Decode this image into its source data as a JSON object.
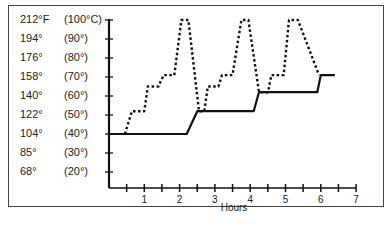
{
  "chart_data": {
    "type": "line",
    "title": "",
    "xlabel": "Hours",
    "ylabel": "Temperature",
    "xlim": [
      0,
      7
    ],
    "ylim": [
      15,
      100
    ],
    "x_ticks": [
      1,
      2,
      3,
      4,
      5,
      6,
      7
    ],
    "x_minor_ticks": [
      0.5,
      1.5,
      2.5,
      3.5,
      4.5,
      5.5,
      6.5
    ],
    "y_ticks": [
      {
        "c": 100,
        "label_f": "212°F",
        "label_c": "(100°C)"
      },
      {
        "c": 90,
        "label_f": "194°",
        "label_c": "(90°)"
      },
      {
        "c": 80,
        "label_f": "176°",
        "label_c": "(80°)"
      },
      {
        "c": 70,
        "label_f": "158°",
        "label_c": "(70°)"
      },
      {
        "c": 60,
        "label_f": "140°",
        "label_c": "(60°)"
      },
      {
        "c": 50,
        "label_f": "122°",
        "label_c": "(50°)"
      },
      {
        "c": 40,
        "label_f": "104°",
        "label_c": "(40°)"
      },
      {
        "c": 30,
        "label_f": "85°",
        "label_c": "(30°)"
      },
      {
        "c": 20,
        "label_f": "68°",
        "label_c": "(20°)"
      }
    ],
    "grid": false,
    "legend": null,
    "series": [
      {
        "name": "solid",
        "style": "solid",
        "x": [
          0,
          2.2,
          2.5,
          4.1,
          4.25,
          5.9,
          6.0,
          6.4
        ],
        "y": [
          40,
          40,
          52,
          52,
          62,
          62,
          71,
          71
        ]
      },
      {
        "name": "dotted",
        "style": "dotted",
        "x": [
          0.45,
          0.65,
          1.0,
          1.1,
          1.4,
          1.55,
          1.85,
          2.05,
          2.25,
          2.55,
          2.7,
          2.8,
          3.1,
          3.2,
          3.5,
          3.75,
          3.95,
          4.25,
          4.5,
          4.6,
          4.95,
          5.1,
          5.35,
          5.95
        ],
        "y": [
          40,
          52,
          52,
          65,
          65,
          71,
          71,
          100,
          100,
          52,
          52,
          65,
          65,
          71,
          71,
          100,
          100,
          62,
          62,
          71,
          71,
          100,
          100,
          71
        ]
      }
    ]
  },
  "axes": {
    "x_title": "Hours"
  }
}
